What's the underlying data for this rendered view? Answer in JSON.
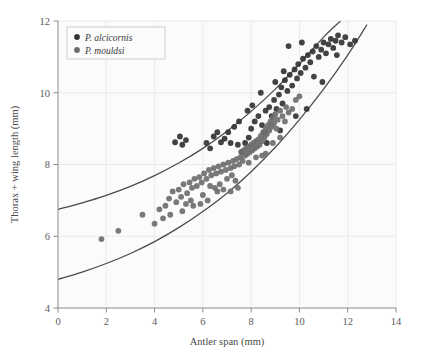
{
  "chart_data": {
    "type": "scatter",
    "title": "",
    "xlabel": "Antler span (mm)",
    "ylabel": "Thorax + wing length (mm)",
    "xlim": [
      0,
      14
    ],
    "ylim": [
      4,
      12
    ],
    "xticks": [
      0,
      2,
      4,
      6,
      8,
      10,
      12,
      14
    ],
    "yticks": [
      4,
      6,
      8,
      10,
      12
    ],
    "xtick_labels": [
      "0",
      "2",
      "4",
      "6",
      "8",
      "10",
      "12",
      "14"
    ],
    "ytick_labels": [
      "4",
      "6",
      "8",
      "10",
      "12"
    ],
    "grid": true,
    "grid_color": "#e8e8e8",
    "background": "#fbfbfb",
    "legend_position": "upper-left",
    "series": [
      {
        "name": "P. alcicornis",
        "marker": "circle",
        "color": "#333333",
        "points": [
          [
            4.85,
            8.62
          ],
          [
            5.05,
            8.78
          ],
          [
            5.15,
            8.55
          ],
          [
            5.3,
            8.68
          ],
          [
            6.45,
            8.78
          ],
          [
            6.6,
            8.9
          ],
          [
            6.75,
            8.62
          ],
          [
            6.9,
            8.72
          ],
          [
            7.05,
            8.9
          ],
          [
            7.15,
            8.6
          ],
          [
            7.3,
            9.05
          ],
          [
            6.3,
            8.45
          ],
          [
            7.45,
            8.55
          ],
          [
            7.6,
            8.35
          ],
          [
            7.75,
            8.6
          ],
          [
            7.9,
            8.75
          ],
          [
            8.0,
            9.0
          ],
          [
            8.15,
            9.2
          ],
          [
            8.3,
            9.35
          ],
          [
            8.45,
            9.1
          ],
          [
            8.55,
            8.9
          ],
          [
            8.6,
            9.5
          ],
          [
            8.75,
            9.6
          ],
          [
            8.85,
            9.35
          ],
          [
            8.95,
            9.8
          ],
          [
            9.05,
            9.55
          ],
          [
            9.15,
            9.95
          ],
          [
            9.25,
            10.15
          ],
          [
            9.3,
            9.7
          ],
          [
            9.4,
            10.35
          ],
          [
            9.5,
            10.05
          ],
          [
            9.6,
            10.5
          ],
          [
            9.7,
            10.2
          ],
          [
            9.8,
            10.65
          ],
          [
            9.9,
            10.4
          ],
          [
            9.95,
            10.8
          ],
          [
            10.05,
            10.55
          ],
          [
            10.15,
            10.95
          ],
          [
            10.25,
            10.7
          ],
          [
            10.35,
            11.05
          ],
          [
            10.45,
            10.85
          ],
          [
            10.55,
            11.15
          ],
          [
            10.6,
            10.45
          ],
          [
            10.7,
            11.3
          ],
          [
            10.8,
            11.0
          ],
          [
            10.9,
            11.2
          ],
          [
            11.0,
            11.4
          ],
          [
            11.1,
            11.1
          ],
          [
            11.2,
            11.35
          ],
          [
            11.3,
            11.5
          ],
          [
            11.4,
            11.25
          ],
          [
            11.5,
            11.45
          ],
          [
            11.6,
            11.6
          ],
          [
            11.75,
            11.4
          ],
          [
            11.9,
            11.55
          ],
          [
            12.1,
            11.35
          ],
          [
            12.3,
            11.45
          ],
          [
            9.55,
            11.3
          ],
          [
            10.1,
            11.4
          ],
          [
            8.4,
            10.0
          ],
          [
            7.85,
            9.5
          ],
          [
            8.05,
            9.65
          ],
          [
            9.0,
            10.3
          ],
          [
            9.35,
            10.6
          ],
          [
            10.3,
            9.55
          ],
          [
            10.95,
            10.3
          ],
          [
            9.85,
            9.35
          ],
          [
            9.2,
            8.95
          ],
          [
            8.65,
            8.6
          ],
          [
            7.5,
            9.2
          ],
          [
            6.15,
            8.6
          ],
          [
            11.55,
            11.05
          ]
        ]
      },
      {
        "name": "P. mouldsi",
        "marker": "circle",
        "color": "#6e6e6e",
        "points": [
          [
            1.8,
            5.92
          ],
          [
            2.5,
            6.15
          ],
          [
            3.5,
            6.6
          ],
          [
            4.0,
            6.35
          ],
          [
            4.45,
            6.85
          ],
          [
            4.6,
            7.05
          ],
          [
            4.75,
            7.25
          ],
          [
            4.9,
            6.95
          ],
          [
            5.0,
            7.3
          ],
          [
            5.1,
            7.1
          ],
          [
            5.2,
            7.45
          ],
          [
            5.35,
            7.2
          ],
          [
            5.45,
            7.5
          ],
          [
            5.55,
            7.35
          ],
          [
            5.65,
            7.6
          ],
          [
            5.75,
            7.4
          ],
          [
            5.85,
            7.65
          ],
          [
            5.95,
            7.5
          ],
          [
            6.05,
            7.75
          ],
          [
            6.15,
            7.6
          ],
          [
            6.25,
            7.85
          ],
          [
            6.35,
            7.7
          ],
          [
            6.45,
            7.9
          ],
          [
            6.55,
            7.75
          ],
          [
            6.65,
            7.95
          ],
          [
            6.75,
            7.8
          ],
          [
            6.85,
            8.0
          ],
          [
            6.95,
            7.85
          ],
          [
            7.05,
            8.05
          ],
          [
            7.15,
            7.9
          ],
          [
            7.25,
            8.1
          ],
          [
            7.3,
            7.95
          ],
          [
            7.4,
            8.15
          ],
          [
            7.5,
            8.0
          ],
          [
            7.55,
            8.2
          ],
          [
            7.6,
            8.35
          ],
          [
            7.65,
            8.1
          ],
          [
            7.7,
            8.4
          ],
          [
            7.75,
            8.25
          ],
          [
            7.8,
            8.45
          ],
          [
            7.85,
            8.3
          ],
          [
            7.9,
            8.5
          ],
          [
            7.95,
            8.35
          ],
          [
            8.0,
            8.55
          ],
          [
            8.05,
            8.4
          ],
          [
            8.1,
            8.6
          ],
          [
            8.15,
            8.45
          ],
          [
            8.2,
            8.65
          ],
          [
            8.25,
            8.5
          ],
          [
            8.3,
            8.7
          ],
          [
            8.35,
            8.55
          ],
          [
            8.4,
            8.8
          ],
          [
            8.45,
            8.65
          ],
          [
            8.5,
            8.9
          ],
          [
            8.55,
            8.75
          ],
          [
            8.6,
            9.0
          ],
          [
            8.65,
            8.85
          ],
          [
            8.7,
            9.1
          ],
          [
            8.75,
            8.95
          ],
          [
            8.8,
            9.2
          ],
          [
            8.85,
            9.05
          ],
          [
            8.9,
            9.3
          ],
          [
            8.95,
            9.15
          ],
          [
            9.0,
            9.4
          ],
          [
            9.1,
            9.25
          ],
          [
            9.2,
            9.5
          ],
          [
            9.3,
            9.35
          ],
          [
            9.45,
            9.6
          ],
          [
            5.3,
            6.9
          ],
          [
            5.6,
            6.85
          ],
          [
            6.0,
            7.15
          ],
          [
            6.2,
            7.0
          ],
          [
            4.2,
            6.75
          ],
          [
            4.35,
            6.5
          ],
          [
            6.5,
            7.35
          ],
          [
            7.0,
            7.6
          ],
          [
            5.9,
            6.9
          ],
          [
            6.7,
            7.45
          ],
          [
            7.2,
            7.7
          ],
          [
            7.35,
            7.55
          ],
          [
            9.55,
            9.45
          ],
          [
            9.7,
            9.55
          ],
          [
            9.85,
            9.8
          ],
          [
            8.9,
            8.6
          ],
          [
            9.2,
            8.75
          ],
          [
            7.45,
            7.35
          ],
          [
            7.15,
            7.25
          ],
          [
            6.85,
            7.3
          ],
          [
            8.6,
            8.3
          ],
          [
            9.05,
            9.0
          ],
          [
            9.4,
            9.2
          ],
          [
            10.0,
            9.9
          ],
          [
            8.2,
            8.2
          ],
          [
            8.45,
            8.25
          ],
          [
            7.9,
            8.05
          ],
          [
            6.6,
            7.25
          ],
          [
            5.15,
            6.7
          ],
          [
            4.65,
            6.6
          ],
          [
            5.5,
            7.0
          ],
          [
            6.3,
            7.4
          ]
        ]
      }
    ],
    "fit_curves": [
      {
        "name": "upper-fit",
        "for_series": "P. alcicornis",
        "color": "#4a4a4a",
        "points": [
          [
            0,
            6.75
          ],
          [
            1,
            6.93
          ],
          [
            2,
            7.14
          ],
          [
            3,
            7.39
          ],
          [
            4,
            7.69
          ],
          [
            5,
            8.04
          ],
          [
            6,
            8.45
          ],
          [
            7,
            8.93
          ],
          [
            8,
            9.48
          ],
          [
            9,
            10.1
          ],
          [
            10,
            10.8
          ],
          [
            11,
            11.55
          ],
          [
            11.7,
            12.0
          ]
        ]
      },
      {
        "name": "lower-fit",
        "for_series": "P. mouldsi",
        "color": "#4a4a4a",
        "points": [
          [
            0,
            4.8
          ],
          [
            1,
            5.0
          ],
          [
            2,
            5.24
          ],
          [
            3,
            5.52
          ],
          [
            4,
            5.85
          ],
          [
            5,
            6.24
          ],
          [
            6,
            6.69
          ],
          [
            7,
            7.2
          ],
          [
            8,
            7.8
          ],
          [
            9,
            8.48
          ],
          [
            10,
            9.25
          ],
          [
            11,
            10.1
          ],
          [
            12,
            11.05
          ],
          [
            12.8,
            11.9
          ]
        ]
      }
    ]
  },
  "legend": {
    "entries": [
      {
        "label": "P. alcicornis",
        "color": "#333333"
      },
      {
        "label": "P. mouldsi",
        "color": "#6e6e6e"
      }
    ]
  }
}
